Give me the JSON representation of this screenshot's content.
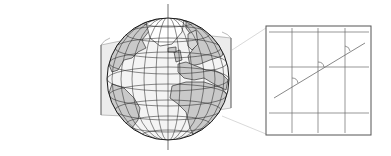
{
  "figure": {
    "title": "Mercator projection: cylinder around globe with rhumb-line inset",
    "colors": {
      "background": "#ffffff",
      "ocean": "#f4f4f4",
      "land": "#c9c9c9",
      "graticule": "#2b2b2b",
      "outline": "#1a1a1a",
      "cylinder_fill": "#e6e6e6",
      "connector": "#cfcfcf",
      "inset_border": "#555555",
      "inset_grid": "#6a6a6a"
    },
    "globe": {
      "label": "globe",
      "center": [
        168,
        79
      ],
      "radius": 61,
      "meridian_count": 12,
      "parallel_count": 8
    },
    "cylinder": {
      "label": "projection cylinder"
    },
    "inset": {
      "label": "rhumb line detail",
      "box": [
        266,
        26,
        105,
        109
      ],
      "horizontal_lines_y": [
        32,
        67,
        113
      ],
      "vertical_lines_x": [
        292,
        318,
        345
      ],
      "rhumb_line": [
        [
          274,
          98
        ],
        [
          365,
          43
        ]
      ],
      "angle_marks": 3
    }
  }
}
